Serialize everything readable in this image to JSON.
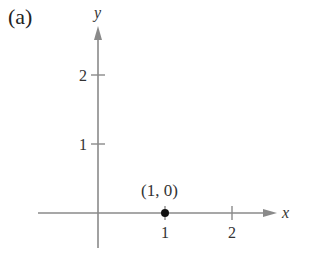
{
  "figure": {
    "panel_label": "(a)",
    "x_axis_label": "x",
    "y_axis_label": "y",
    "x_ticks": [
      {
        "value": 1,
        "label": "1"
      },
      {
        "value": 2,
        "label": "2"
      }
    ],
    "y_ticks": [
      {
        "value": 1,
        "label": "1"
      },
      {
        "value": 2,
        "label": "2"
      }
    ],
    "point": {
      "x": 1,
      "y": 0,
      "label": "(1, 0)"
    },
    "colors": {
      "axis": "#8a8a8a",
      "point": "#111111",
      "text": "#333333"
    }
  }
}
